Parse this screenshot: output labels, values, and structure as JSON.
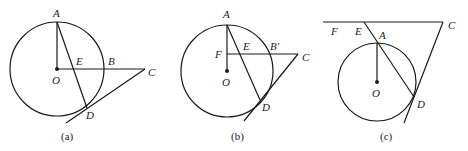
{
  "figures": [
    {
      "caption": "(a)",
      "labels": {
        "A": "A",
        "B": "B",
        "C": "C",
        "D": "D",
        "E": "E",
        "O": "O"
      }
    },
    {
      "caption": "(b)",
      "labels": {
        "A": "A",
        "B": "B′",
        "C": "C",
        "D": "D",
        "E": "E",
        "F": "F",
        "O": "O"
      }
    },
    {
      "caption": "(c)",
      "labels": {
        "A": "A",
        "C": "C",
        "D": "D",
        "E": "E",
        "F": "F",
        "O": "O"
      }
    }
  ]
}
